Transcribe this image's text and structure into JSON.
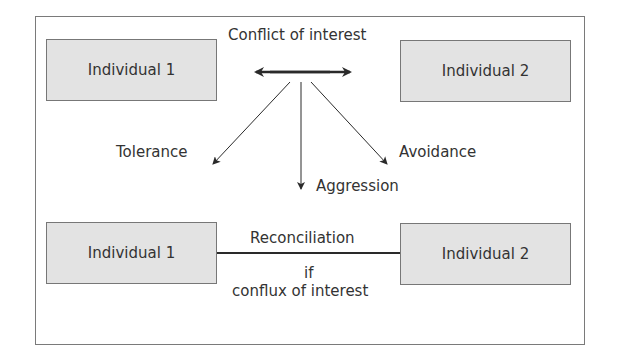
{
  "diagram": {
    "top": {
      "left_box": "Individual 1",
      "right_box": "Individual 2",
      "connector_label": "Conflict of interest"
    },
    "outcomes": {
      "left": "Tolerance",
      "center": "Aggression",
      "right": "Avoidance"
    },
    "bottom": {
      "left_box": "Individual 1",
      "right_box": "Individual 2",
      "connector_label": "Reconciliation",
      "condition_line1": "if",
      "condition_line2": "conflux of interest"
    }
  },
  "colors": {
    "box_fill": "#e3e3e3",
    "box_border": "#777777",
    "line": "#2a2a2a",
    "frame": "#7a7a7a"
  }
}
